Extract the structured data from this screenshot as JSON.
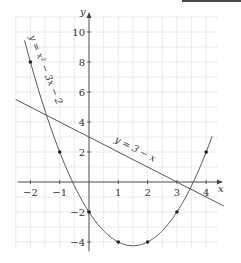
{
  "chart_data": {
    "type": "line",
    "title": "",
    "xlabel": "x",
    "ylabel": "y",
    "xlim": [
      -2.5,
      4.4
    ],
    "ylim": [
      -4.5,
      11
    ],
    "grid": true,
    "xticks": [
      -2,
      -1,
      1,
      2,
      3,
      4
    ],
    "yticks": [
      -4,
      -2,
      2,
      4,
      6,
      8,
      10
    ],
    "xtick_labels": [
      "−2",
      "−1",
      "1",
      "2",
      "3",
      "4"
    ],
    "ytick_labels": [
      "−4",
      "−2",
      "2",
      "4",
      "6",
      "8",
      "10"
    ],
    "series": [
      {
        "name": "y = x² − 3x − 2",
        "kind": "curve",
        "equation": "x^2 - 3x - 2",
        "x_range": [
          -2.2,
          4.2
        ],
        "points": [
          {
            "x": -2,
            "y": 8
          },
          {
            "x": -1,
            "y": 2
          },
          {
            "x": 0,
            "y": -2
          },
          {
            "x": 1,
            "y": -4
          },
          {
            "x": 2,
            "y": -4
          },
          {
            "x": 3,
            "y": -2
          },
          {
            "x": 4,
            "y": 2
          }
        ]
      },
      {
        "name": "y = 3 − x",
        "kind": "line",
        "equation": "3 - x",
        "x_range": [
          -2.5,
          4.6
        ]
      }
    ],
    "annotations": [
      {
        "text": "y = x² − 3x − 2",
        "position": "along parabola, upper left"
      },
      {
        "text": "y = 3 − x",
        "position": "along line, right of y-axis"
      }
    ]
  },
  "labels": {
    "x_axis": "x",
    "y_axis": "y",
    "parabola": "y = x² − 3x − 2",
    "line": "y = 3 − x"
  },
  "colors": {
    "grid": "#c8c8c8",
    "axis": "#444444",
    "curve": "#555555",
    "points": "#222222"
  }
}
